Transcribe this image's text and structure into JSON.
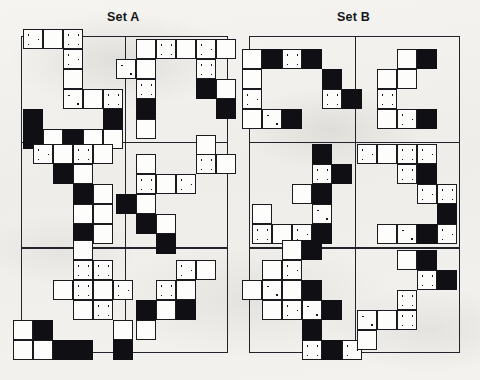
{
  "page": {
    "background_color": "#f2f1ee",
    "ink_color": "#101014",
    "tile_fill_white": "#fdfdfb",
    "tile_fill_black": "#101014"
  },
  "sets": [
    {
      "id": "set-a",
      "title": "Set A",
      "frame": {
        "x": 21,
        "y": 36,
        "width": 207,
        "height": 317
      },
      "columns": 2,
      "rows": 3,
      "cells": [
        {
          "id": "a-r1c1",
          "label": "Set A row 1 cell 1",
          "tiles": [
            {
              "col": 1,
              "row": 0,
              "fill": "dots"
            },
            {
              "col": 2,
              "row": 0,
              "fill": "white"
            },
            {
              "col": 3,
              "row": 0,
              "fill": "dots"
            },
            {
              "col": 3,
              "row": 1,
              "fill": "dots"
            },
            {
              "col": 3,
              "row": 2,
              "fill": "white"
            },
            {
              "col": 3,
              "row": 3,
              "fill": "dots"
            },
            {
              "col": 4,
              "row": 3,
              "fill": "white"
            },
            {
              "col": 5,
              "row": 3,
              "fill": "dots"
            },
            {
              "col": 1,
              "row": 4,
              "fill": "black"
            },
            {
              "col": 5,
              "row": 4,
              "fill": "black"
            },
            {
              "col": 1,
              "row": 5,
              "fill": "black"
            },
            {
              "col": 2,
              "row": 5,
              "fill": "white"
            },
            {
              "col": 3,
              "row": 5,
              "fill": "black"
            },
            {
              "col": 4,
              "row": 5,
              "fill": "white"
            },
            {
              "col": 5,
              "row": 5,
              "fill": "white"
            }
          ]
        },
        {
          "id": "a-r1c2",
          "label": "Set A row 1 cell 2",
          "tiles": [
            {
              "col": 1,
              "row": 0,
              "fill": "white"
            },
            {
              "col": 2,
              "row": 0,
              "fill": "dots"
            },
            {
              "col": 3,
              "row": 0,
              "fill": "white"
            },
            {
              "col": 4,
              "row": 0,
              "fill": "dots"
            },
            {
              "col": 5,
              "row": 0,
              "fill": "white"
            },
            {
              "col": 0,
              "row": 1,
              "fill": "dots"
            },
            {
              "col": 1,
              "row": 1,
              "fill": "white"
            },
            {
              "col": 4,
              "row": 1,
              "fill": "dots"
            },
            {
              "col": 1,
              "row": 2,
              "fill": "dots"
            },
            {
              "col": 4,
              "row": 2,
              "fill": "black"
            },
            {
              "col": 5,
              "row": 2,
              "fill": "white"
            },
            {
              "col": 1,
              "row": 3,
              "fill": "black"
            },
            {
              "col": 5,
              "row": 3,
              "fill": "black"
            },
            {
              "col": 1,
              "row": 4,
              "fill": "white"
            }
          ]
        },
        {
          "id": "a-r2c1",
          "label": "Set A row 2 cell 1",
          "tiles": [
            {
              "col": 0,
              "row": 0,
              "fill": "dots"
            },
            {
              "col": 1,
              "row": 0,
              "fill": "white"
            },
            {
              "col": 2,
              "row": 0,
              "fill": "dots"
            },
            {
              "col": 3,
              "row": 0,
              "fill": "white"
            },
            {
              "col": 1,
              "row": 1,
              "fill": "black"
            },
            {
              "col": 2,
              "row": 1,
              "fill": "white"
            },
            {
              "col": 2,
              "row": 2,
              "fill": "black"
            },
            {
              "col": 3,
              "row": 2,
              "fill": "white"
            },
            {
              "col": 2,
              "row": 3,
              "fill": "white"
            },
            {
              "col": 3,
              "row": 3,
              "fill": "white"
            },
            {
              "col": 2,
              "row": 4,
              "fill": "black"
            },
            {
              "col": 3,
              "row": 4,
              "fill": "white"
            }
          ]
        },
        {
          "id": "a-r2c2",
          "label": "Set A row 2 cell 2",
          "tiles": [
            {
              "col": 4,
              "row": 0,
              "fill": "white"
            },
            {
              "col": 4,
              "row": 1,
              "fill": "dots"
            },
            {
              "col": 5,
              "row": 1,
              "fill": "white"
            },
            {
              "col": 1,
              "row": 1,
              "fill": "white"
            },
            {
              "col": 1,
              "row": 2,
              "fill": "dots"
            },
            {
              "col": 2,
              "row": 2,
              "fill": "white"
            },
            {
              "col": 3,
              "row": 2,
              "fill": "dots"
            },
            {
              "col": 0,
              "row": 3,
              "fill": "black"
            },
            {
              "col": 1,
              "row": 3,
              "fill": "white"
            },
            {
              "col": 1,
              "row": 4,
              "fill": "black"
            },
            {
              "col": 2,
              "row": 4,
              "fill": "white"
            },
            {
              "col": 2,
              "row": 5,
              "fill": "black"
            }
          ]
        },
        {
          "id": "a-r3c1",
          "label": "Set A row 3 cell 1",
          "tiles": [
            {
              "col": 3,
              "row": 0,
              "fill": "white"
            },
            {
              "col": 3,
              "row": 1,
              "fill": "dots"
            },
            {
              "col": 4,
              "row": 1,
              "fill": "dots"
            },
            {
              "col": 2,
              "row": 2,
              "fill": "white"
            },
            {
              "col": 3,
              "row": 2,
              "fill": "dots"
            },
            {
              "col": 4,
              "row": 2,
              "fill": "white"
            },
            {
              "col": 5,
              "row": 2,
              "fill": "dots"
            },
            {
              "col": 3,
              "row": 3,
              "fill": "white"
            },
            {
              "col": 4,
              "row": 3,
              "fill": "dots"
            },
            {
              "col": 0,
              "row": 4,
              "fill": "white"
            },
            {
              "col": 1,
              "row": 4,
              "fill": "black"
            },
            {
              "col": 5,
              "row": 4,
              "fill": "white"
            },
            {
              "col": 0,
              "row": 5,
              "fill": "white"
            },
            {
              "col": 1,
              "row": 5,
              "fill": "white"
            },
            {
              "col": 2,
              "row": 5,
              "fill": "black"
            },
            {
              "col": 3,
              "row": 5,
              "fill": "black"
            },
            {
              "col": 5,
              "row": 5,
              "fill": "black"
            }
          ]
        },
        {
          "id": "a-r3c2",
          "label": "Set A row 3 cell 2",
          "tiles": [
            {
              "col": 3,
              "row": 1,
              "fill": "dots"
            },
            {
              "col": 4,
              "row": 1,
              "fill": "white"
            },
            {
              "col": 2,
              "row": 2,
              "fill": "dots"
            },
            {
              "col": 3,
              "row": 2,
              "fill": "white"
            },
            {
              "col": 1,
              "row": 3,
              "fill": "black"
            },
            {
              "col": 2,
              "row": 3,
              "fill": "white"
            },
            {
              "col": 3,
              "row": 3,
              "fill": "black"
            },
            {
              "col": 1,
              "row": 4,
              "fill": "white"
            }
          ]
        }
      ]
    },
    {
      "id": "set-b",
      "title": "Set B",
      "frame": {
        "x": 249,
        "y": 36,
        "width": 211,
        "height": 317
      },
      "columns": 2,
      "rows": 3,
      "cells": [
        {
          "id": "b-r1c1",
          "label": "Set B row 1 cell 1",
          "tiles": [
            {
              "col": 0,
              "row": 0,
              "fill": "white"
            },
            {
              "col": 1,
              "row": 0,
              "fill": "black"
            },
            {
              "col": 2,
              "row": 0,
              "fill": "dots"
            },
            {
              "col": 3,
              "row": 0,
              "fill": "black"
            },
            {
              "col": 0,
              "row": 1,
              "fill": "white"
            },
            {
              "col": 4,
              "row": 1,
              "fill": "black"
            },
            {
              "col": 0,
              "row": 2,
              "fill": "dots"
            },
            {
              "col": 4,
              "row": 2,
              "fill": "dots"
            },
            {
              "col": 5,
              "row": 2,
              "fill": "black"
            },
            {
              "col": 0,
              "row": 3,
              "fill": "white"
            },
            {
              "col": 1,
              "row": 3,
              "fill": "dots"
            },
            {
              "col": 2,
              "row": 3,
              "fill": "black"
            }
          ]
        },
        {
          "id": "b-r1c2",
          "label": "Set B row 1 cell 2",
          "tiles": [
            {
              "col": 2,
              "row": 0,
              "fill": "white"
            },
            {
              "col": 3,
              "row": 0,
              "fill": "black"
            },
            {
              "col": 1,
              "row": 1,
              "fill": "white"
            },
            {
              "col": 2,
              "row": 1,
              "fill": "white"
            },
            {
              "col": 1,
              "row": 2,
              "fill": "dots"
            },
            {
              "col": 1,
              "row": 3,
              "fill": "white"
            },
            {
              "col": 2,
              "row": 3,
              "fill": "dots"
            },
            {
              "col": 3,
              "row": 3,
              "fill": "black"
            }
          ]
        },
        {
          "id": "b-r2c1",
          "label": "Set B row 2 cell 1",
          "tiles": [
            {
              "col": 3,
              "row": 0,
              "fill": "black"
            },
            {
              "col": 3,
              "row": 1,
              "fill": "dots"
            },
            {
              "col": 4,
              "row": 1,
              "fill": "black"
            },
            {
              "col": 2,
              "row": 2,
              "fill": "white"
            },
            {
              "col": 3,
              "row": 2,
              "fill": "black"
            },
            {
              "col": 3,
              "row": 3,
              "fill": "dots"
            },
            {
              "col": 0,
              "row": 3,
              "fill": "white"
            },
            {
              "col": 0,
              "row": 4,
              "fill": "dots"
            },
            {
              "col": 1,
              "row": 4,
              "fill": "white"
            },
            {
              "col": 2,
              "row": 4,
              "fill": "dots"
            },
            {
              "col": 3,
              "row": 4,
              "fill": "black"
            }
          ]
        },
        {
          "id": "b-r2c2",
          "label": "Set B row 2 cell 2",
          "tiles": [
            {
              "col": 0,
              "row": 0,
              "fill": "dots"
            },
            {
              "col": 1,
              "row": 0,
              "fill": "white"
            },
            {
              "col": 2,
              "row": 0,
              "fill": "dots"
            },
            {
              "col": 3,
              "row": 0,
              "fill": "dots"
            },
            {
              "col": 2,
              "row": 1,
              "fill": "dots"
            },
            {
              "col": 3,
              "row": 1,
              "fill": "black"
            },
            {
              "col": 3,
              "row": 2,
              "fill": "dots"
            },
            {
              "col": 4,
              "row": 2,
              "fill": "dots"
            },
            {
              "col": 4,
              "row": 3,
              "fill": "black"
            },
            {
              "col": 1,
              "row": 4,
              "fill": "white"
            },
            {
              "col": 2,
              "row": 4,
              "fill": "dots"
            },
            {
              "col": 3,
              "row": 4,
              "fill": "black"
            },
            {
              "col": 4,
              "row": 4,
              "fill": "dots"
            }
          ]
        },
        {
          "id": "b-r3c1",
          "label": "Set B row 3 cell 1",
          "tiles": [
            {
              "col": 2,
              "row": 0,
              "fill": "white"
            },
            {
              "col": 3,
              "row": 0,
              "fill": "black"
            },
            {
              "col": 1,
              "row": 1,
              "fill": "white"
            },
            {
              "col": 2,
              "row": 1,
              "fill": "dots"
            },
            {
              "col": 0,
              "row": 2,
              "fill": "white"
            },
            {
              "col": 1,
              "row": 2,
              "fill": "dots"
            },
            {
              "col": 2,
              "row": 2,
              "fill": "white"
            },
            {
              "col": 3,
              "row": 2,
              "fill": "black"
            },
            {
              "col": 1,
              "row": 3,
              "fill": "white"
            },
            {
              "col": 2,
              "row": 3,
              "fill": "dots"
            },
            {
              "col": 3,
              "row": 3,
              "fill": "dots"
            },
            {
              "col": 4,
              "row": 3,
              "fill": "black"
            },
            {
              "col": 3,
              "row": 4,
              "fill": "black"
            },
            {
              "col": 3,
              "row": 5,
              "fill": "dots"
            },
            {
              "col": 4,
              "row": 5,
              "fill": "black"
            },
            {
              "col": 5,
              "row": 5,
              "fill": "dots"
            }
          ]
        },
        {
          "id": "b-r3c2",
          "label": "Set B row 3 cell 2",
          "tiles": [
            {
              "col": 3,
              "row": 0,
              "fill": "white"
            },
            {
              "col": 4,
              "row": 0,
              "fill": "black"
            },
            {
              "col": 4,
              "row": 1,
              "fill": "dots"
            },
            {
              "col": 5,
              "row": 1,
              "fill": "black"
            },
            {
              "col": 3,
              "row": 2,
              "fill": "dots"
            },
            {
              "col": 1,
              "row": 3,
              "fill": "dots"
            },
            {
              "col": 2,
              "row": 3,
              "fill": "white"
            },
            {
              "col": 3,
              "row": 3,
              "fill": "dots"
            },
            {
              "col": 1,
              "row": 4,
              "fill": "white"
            }
          ]
        }
      ]
    }
  ]
}
